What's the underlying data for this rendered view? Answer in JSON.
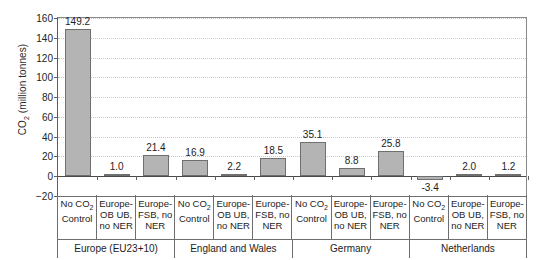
{
  "chart_data": {
    "type": "bar",
    "title": "",
    "xlabel": "",
    "ylabel": "CO2 (million tonnes)",
    "ylabel_parts": {
      "prefix": "CO",
      "sub": "2",
      "suffix": " (million tonnes)"
    },
    "ylim": [
      -20,
      160
    ],
    "yticks": [
      -20,
      0,
      20,
      40,
      60,
      80,
      100,
      120,
      140,
      160
    ],
    "ytick_labels": [
      "−20",
      "0",
      "20",
      "40",
      "60",
      "80",
      "100",
      "120",
      "140",
      "160"
    ],
    "grid": true,
    "legend": "none",
    "bar_color": "#b4b4b4",
    "bar_edge_color": "#6f6f6f",
    "categories": [
      "No CO2 Control",
      "Europe-OB UB, no NER",
      "Europe-FSB, no NER",
      "No CO2 Control",
      "Europe-OB UB, no NER",
      "Europe-FSB, no NER",
      "No CO2 Control",
      "Europe-OB UB, no NER",
      "Europe-FSB, no NER",
      "No CO2 Control",
      "Europe-OB UB, no NER",
      "Europe-FSB, no NER"
    ],
    "values": [
      149.2,
      1.0,
      21.4,
      16.9,
      2.2,
      18.5,
      35.1,
      8.8,
      25.8,
      -3.4,
      2.0,
      1.2
    ],
    "data_labels": [
      "149.2",
      "1.0",
      "21.4",
      "16.9",
      "2.2",
      "18.5",
      "35.1",
      "8.8",
      "25.8",
      "-3.4",
      "2.0",
      "1.2"
    ],
    "groups": [
      {
        "label": "Europe (EU23+10)",
        "span": 3
      },
      {
        "label": "England and Wales",
        "span": 3
      },
      {
        "label": "Germany",
        "span": 3
      },
      {
        "label": "Netherlands",
        "span": 3
      }
    ]
  },
  "axis_cells": [
    {
      "line1": "No CO",
      "sub": "2",
      "line1b": "",
      "line2": "Control",
      "line3": ""
    },
    {
      "line1": "Europe-",
      "sub": "",
      "line1b": "",
      "line2": "OB UB,",
      "line3": "no NER"
    },
    {
      "line1": "Europe-",
      "sub": "",
      "line1b": "",
      "line2": "FSB, no",
      "line3": "NER"
    },
    {
      "line1": "No CO",
      "sub": "2",
      "line1b": "",
      "line2": "Control",
      "line3": ""
    },
    {
      "line1": "Europe-",
      "sub": "",
      "line1b": "",
      "line2": "OB UB,",
      "line3": "no NER"
    },
    {
      "line1": "Europe-",
      "sub": "",
      "line1b": "",
      "line2": "FSB, no",
      "line3": "NER"
    },
    {
      "line1": "No CO",
      "sub": "2",
      "line1b": "",
      "line2": "Control",
      "line3": ""
    },
    {
      "line1": "Europe-",
      "sub": "",
      "line1b": "",
      "line2": "OB UB,",
      "line3": "no NER"
    },
    {
      "line1": "Europe-",
      "sub": "",
      "line1b": "",
      "line2": "FSB, no",
      "line3": "NER"
    },
    {
      "line1": "No CO",
      "sub": "2",
      "line1b": "",
      "line2": "Control",
      "line3": ""
    },
    {
      "line1": "Europe-",
      "sub": "",
      "line1b": "",
      "line2": "OB UB,",
      "line3": "no NER"
    },
    {
      "line1": "Europe-",
      "sub": "",
      "line1b": "",
      "line2": "FSB, no",
      "line3": "NER"
    }
  ]
}
